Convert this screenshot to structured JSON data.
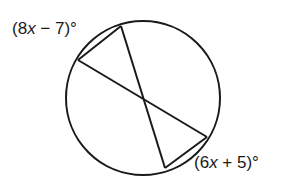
{
  "diagram": {
    "type": "circle-intersecting-chords",
    "stroke_color": "#1a1a1a",
    "circle": {
      "cx": 143,
      "cy": 98,
      "r": 77
    },
    "points": {
      "A": {
        "x": 78,
        "y": 60
      },
      "B": {
        "x": 121,
        "y": 26
      },
      "C": {
        "x": 207,
        "y": 137
      },
      "D": {
        "x": 165,
        "y": 168
      }
    },
    "chords": [
      {
        "from": "A",
        "to": "C"
      },
      {
        "from": "B",
        "to": "D"
      },
      {
        "from": "A",
        "to": "B"
      },
      {
        "from": "D",
        "to": "C"
      }
    ],
    "arc_labels": {
      "top_left": {
        "open": "(8",
        "var": "x",
        "rest": " − 7)°"
      },
      "bottom_right": {
        "open": "(6",
        "var": "x",
        "rest": " + 5)°"
      }
    }
  }
}
